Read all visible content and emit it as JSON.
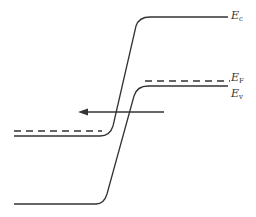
{
  "diagram": {
    "type": "energy-band-diagram",
    "labels": {
      "ec": {
        "main": "E",
        "sub": "c"
      },
      "ef": {
        "main": "E",
        "sub": "F"
      },
      "ev": {
        "main": "E",
        "sub": "v"
      }
    },
    "colors": {
      "line": "#333333",
      "background": "#ffffff"
    },
    "elements": [
      "conduction band edge (E_c)",
      "Fermi level (E_F, dashed)",
      "valence band edge (E_v)",
      "arrow pointing left"
    ]
  }
}
